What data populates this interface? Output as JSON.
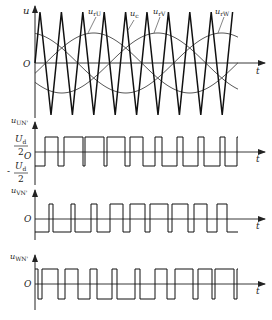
{
  "figure": {
    "colors": {
      "line": "#1a1a1a",
      "sine": "#333333",
      "axis": "#222222"
    },
    "panel_top": {
      "y_axis_label": "u",
      "x_axis_label": "t",
      "origin_label": "O",
      "curve_labels": [
        {
          "main": "u",
          "sub": "rU"
        },
        {
          "main": "u",
          "sub": "c"
        },
        {
          "main": "u",
          "sub": "rV"
        },
        {
          "main": "u",
          "sub": "rW"
        }
      ]
    },
    "panel_un": {
      "y_axis_label_main": "u",
      "y_axis_label_sub": "UN'",
      "x_axis_label": "t",
      "origin_label": "O",
      "level_high": {
        "num": "U",
        "num_sub": "d",
        "den": "2"
      },
      "level_low": {
        "sign": "-",
        "num": "U",
        "num_sub": "d",
        "den": "2"
      }
    },
    "panel_vn": {
      "y_axis_label_main": "u",
      "y_axis_label_sub": "VN'",
      "x_axis_label": "t",
      "origin_label": "O"
    },
    "panel_wn": {
      "y_axis_label_main": "u",
      "y_axis_label_sub": "WN'",
      "x_axis_label": "t",
      "origin_label": "O"
    }
  },
  "chart_data": {
    "type": "line",
    "panels": [
      {
        "name": "carrier and references",
        "series": [
          "u_c (triangular carrier, ~9.5 periods)",
          "u_rU (sine)",
          "u_rV (sine, -120°)",
          "u_rW (sine, +120°)"
        ],
        "xlabel": "t",
        "ylabel": "u"
      },
      {
        "name": "u_UN'",
        "levels": [
          "Ud/2",
          "-Ud/2"
        ],
        "xlabel": "t"
      },
      {
        "name": "u_VN'",
        "levels": [
          "+",
          "-"
        ],
        "xlabel": "t"
      },
      {
        "name": "u_WN'",
        "levels": [
          "+",
          "-"
        ],
        "xlabel": "t"
      }
    ]
  }
}
